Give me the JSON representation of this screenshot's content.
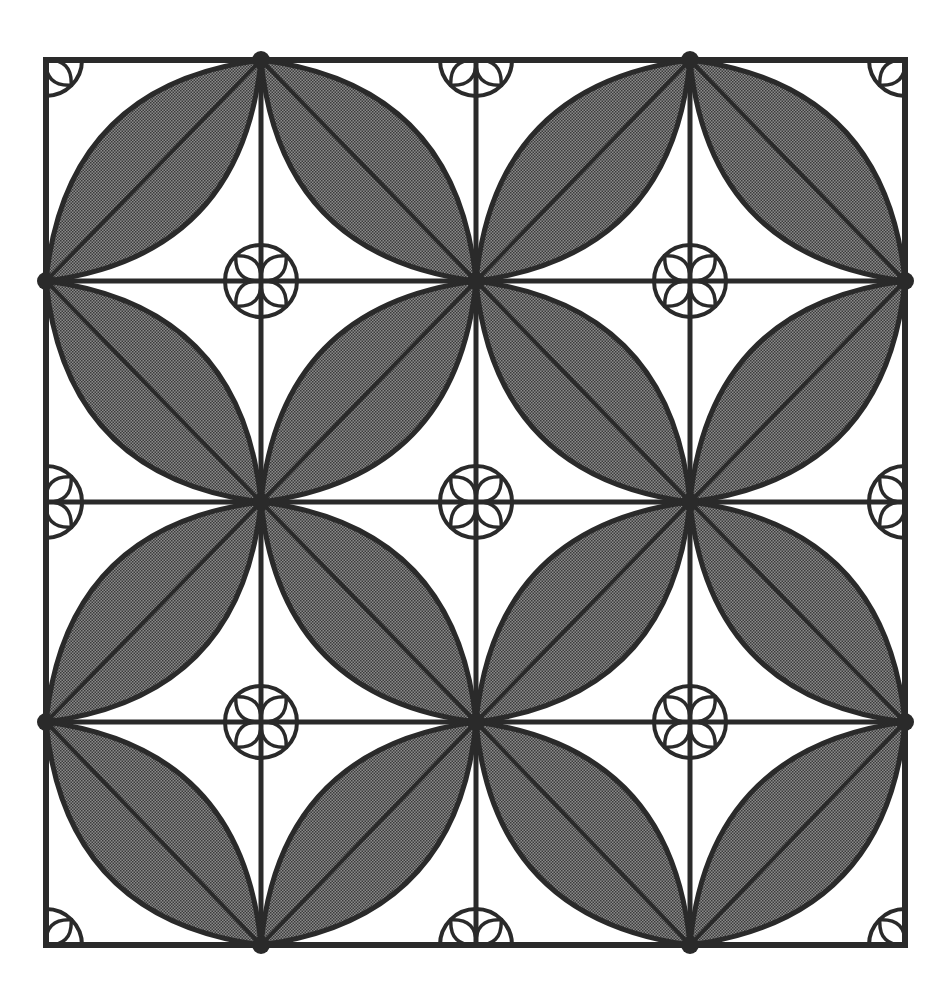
{
  "figure": {
    "colors": {
      "background": "#ffffff",
      "stroke": "#2a2a2a",
      "leaf_fill": "#6b6b6b"
    },
    "frame": {
      "left": 46,
      "top": 60,
      "right": 905,
      "bottom": 945
    },
    "grid": {
      "xs": [
        46,
        261,
        476,
        690,
        905
      ],
      "ys": [
        60,
        281,
        502,
        722,
        945
      ]
    },
    "stroke_width": 5,
    "rosette_radius": 36
  }
}
